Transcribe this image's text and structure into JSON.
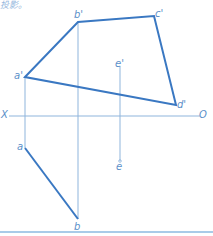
{
  "caption": "投影。",
  "colors": {
    "outline": "#3a78c2",
    "projection": "#8fb5dc",
    "label": "#5b8fc9",
    "rule": "#a9cbe8"
  },
  "axis": {
    "left_label": "X",
    "right_label": "O"
  },
  "points": {
    "a_prime": "a'",
    "b_prime": "b'",
    "c_prime": "c'",
    "d_prime": "d'",
    "e_prime": "e'",
    "a": "a",
    "b": "b",
    "e": "e"
  }
}
